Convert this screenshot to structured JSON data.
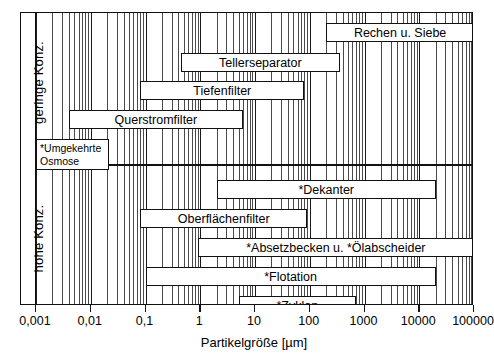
{
  "chart_data": {
    "type": "bar",
    "orientation": "horizontal-range",
    "title": "",
    "xlabel": "Partikelgröße [µm]",
    "ylabel": "",
    "xscale": "log",
    "xlim": [
      0.001,
      100000
    ],
    "grid": true,
    "legend": false,
    "xticks": [
      {
        "value": 0.001,
        "label": "0,001"
      },
      {
        "value": 0.01,
        "label": "0,01"
      },
      {
        "value": 0.1,
        "label": "0,1"
      },
      {
        "value": 1,
        "label": "1"
      },
      {
        "value": 10,
        "label": "10"
      },
      {
        "value": 100,
        "label": "100"
      },
      {
        "value": 1000,
        "label": "1000"
      },
      {
        "value": 10000,
        "label": "10000"
      },
      {
        "value": 100000,
        "label": "100000"
      }
    ],
    "zones": [
      {
        "id": "low",
        "label": "geringe Konz."
      },
      {
        "id": "high",
        "label": "hohe Konz."
      }
    ],
    "bars": [
      {
        "label": "Rechen u. Siebe",
        "zone": "low",
        "x_start": 200,
        "x_end": 100000,
        "lines": [
          "Rechen u. Siebe"
        ]
      },
      {
        "label": "Tellerseparator",
        "zone": "low",
        "x_start": 0.45,
        "x_end": 350,
        "lines": [
          "Tellerseparator"
        ]
      },
      {
        "label": "Tiefenfilter",
        "zone": "low",
        "x_start": 0.08,
        "x_end": 80,
        "lines": [
          "Tiefenfilter"
        ]
      },
      {
        "label": "Querstromfilter",
        "zone": "low",
        "x_start": 0.004,
        "x_end": 6,
        "lines": [
          "Querstromfilter"
        ]
      },
      {
        "label": "*Umgekehrte Osmose",
        "zone": "low",
        "x_start": 0.001,
        "x_end": 0.022,
        "lines": [
          "*Umgekehrte",
          "Osmose"
        ]
      },
      {
        "label": "*Dekanter",
        "zone": "high",
        "x_start": 2.0,
        "x_end": 20000,
        "lines": [
          "*Dekanter"
        ]
      },
      {
        "label": "Oberflächenfilter",
        "zone": "high",
        "x_start": 0.08,
        "x_end": 90,
        "lines": [
          "Oberflächenfilter"
        ]
      },
      {
        "label": "*Absetzbecken u. *Ölabscheider",
        "zone": "high",
        "x_start": 0.9,
        "x_end": 100000,
        "lines": [
          "*Absetzbecken u. *Ölabscheider"
        ]
      },
      {
        "label": "*Flotation",
        "zone": "high",
        "x_start": 0.1,
        "x_end": 20000,
        "lines": [
          "*Flotation"
        ]
      },
      {
        "label": "*Zyklon",
        "zone": "high",
        "x_start": 5,
        "x_end": 700,
        "lines": [
          "*Zyklon"
        ]
      }
    ],
    "colors": {
      "bar_fill": "#ffffff",
      "bar_border": "#111111",
      "grid": "#4a4a4a",
      "frame": "#111111",
      "background": "#ffffff"
    }
  }
}
